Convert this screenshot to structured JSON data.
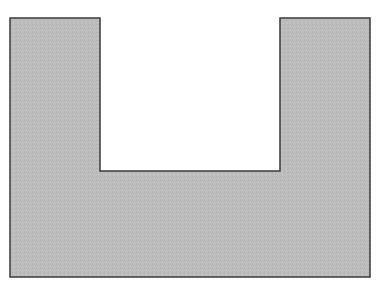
{
  "diagram": {
    "shape": "u-shaped-polygon",
    "fill_color": "#bdbdbd",
    "stroke_color": "#3a3a3a",
    "background_color": "#ffffff",
    "points": [
      [
        10,
        18
      ],
      [
        100,
        18
      ],
      [
        100,
        171
      ],
      [
        280,
        171
      ],
      [
        280,
        18
      ],
      [
        370,
        18
      ],
      [
        370,
        277
      ],
      [
        10,
        277
      ]
    ]
  }
}
